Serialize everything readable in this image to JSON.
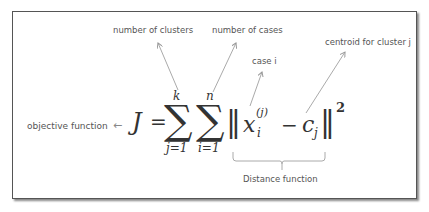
{
  "diagram": {
    "labels": {
      "number_of_clusters": "number of clusters",
      "number_of_cases": "number of cases",
      "case_i": "case i",
      "centroid": "centroid for cluster j",
      "objective": "objective function",
      "distance": "Distance function"
    },
    "formula": {
      "lhs": "J",
      "equals": "=",
      "sum1_upper": "k",
      "sum1_lower": "j=1",
      "sum2_upper": "n",
      "sum2_lower": "i=1",
      "sigma": "∑",
      "norm_open": "‖",
      "x": "x",
      "x_sup": "(j)",
      "x_sub": "i",
      "minus": "−",
      "c": "c",
      "c_sub": "j",
      "norm_close": "‖",
      "power": "2",
      "arrow_left": "←"
    },
    "colors": {
      "text": "#555555",
      "math": "#333333",
      "arrow": "#999999",
      "frame": "#555555"
    }
  }
}
